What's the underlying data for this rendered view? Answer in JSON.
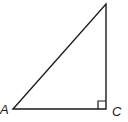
{
  "diagram": {
    "type": "right-triangle",
    "vertices": {
      "A": {
        "label": "A",
        "x": 13,
        "y": 109
      },
      "C": {
        "label": "C",
        "x": 106,
        "y": 109
      },
      "B": {
        "label": "",
        "x": 106,
        "y": 4
      }
    },
    "right_angle_at": "C",
    "right_angle_marker_size": 8,
    "stroke_color": "#1a1a1a",
    "background_color": "#ffffff"
  }
}
